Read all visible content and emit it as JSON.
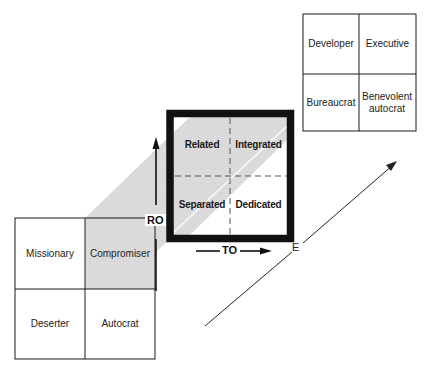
{
  "diagram": {
    "type": "3D grid model",
    "colors": {
      "band": "#d9d9d9",
      "line": "#1a1a1a",
      "thick_border": "#111111",
      "dash": "#555555"
    },
    "left_grid": {
      "cells": [
        {
          "label": "Missionary",
          "shaded": false
        },
        {
          "label": "Compromiser",
          "shaded": true
        },
        {
          "label": "Deserter",
          "shaded": false
        },
        {
          "label": "Autocrat",
          "shaded": false
        }
      ]
    },
    "center_grid": {
      "cells": [
        {
          "label": "Related"
        },
        {
          "label": "Integrated"
        },
        {
          "label": "Separated"
        },
        {
          "label": "Dedicated"
        }
      ]
    },
    "right_grid": {
      "cells": [
        {
          "label": "Developer"
        },
        {
          "label": "Executive"
        },
        {
          "label": "Bureaucrat"
        },
        {
          "label": "Benevolent autocrat"
        }
      ]
    },
    "axes": {
      "vertical": "RO",
      "horizontal": "TO",
      "diagonal": "E"
    }
  }
}
